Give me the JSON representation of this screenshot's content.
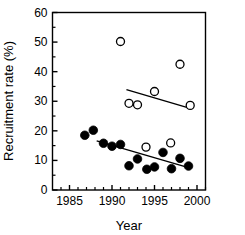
{
  "chart_data": {
    "type": "scatter",
    "title": "",
    "xlabel": "Year",
    "ylabel": "Recruitment rate (%)",
    "xlim": [
      1983,
      2001
    ],
    "ylim": [
      0,
      60
    ],
    "xticks": [
      1985,
      1990,
      1995,
      2000
    ],
    "xtick_labels": [
      "1985",
      "1990",
      "1995",
      "2000"
    ],
    "xminor_ticks": [
      1984,
      1986,
      1987,
      1988,
      1989,
      1991,
      1992,
      1993,
      1994,
      1996,
      1997,
      1998,
      1999,
      2001
    ],
    "yticks": [
      0,
      10,
      20,
      30,
      40,
      50,
      60
    ],
    "ytick_labels": [
      "0",
      "10",
      "20",
      "30",
      "40",
      "50",
      "60"
    ],
    "yminor_ticks": [
      5,
      15,
      25,
      35,
      45,
      55
    ],
    "grid": false,
    "legend": "none",
    "series": [
      {
        "name": "closed-circles",
        "marker": "filled-circle",
        "color": "#000000",
        "points": [
          {
            "x": 1986.8,
            "y": 18.5
          },
          {
            "x": 1987.8,
            "y": 20.2
          },
          {
            "x": 1989.0,
            "y": 15.8
          },
          {
            "x": 1990.0,
            "y": 14.8
          },
          {
            "x": 1991.0,
            "y": 15.4
          },
          {
            "x": 1992.0,
            "y": 8.2
          },
          {
            "x": 1993.0,
            "y": 10.5
          },
          {
            "x": 1994.1,
            "y": 7.0
          },
          {
            "x": 1995.0,
            "y": 7.8
          },
          {
            "x": 1996.0,
            "y": 12.7
          },
          {
            "x": 1997.0,
            "y": 7.2
          },
          {
            "x": 1998.0,
            "y": 10.7
          },
          {
            "x": 1999.0,
            "y": 8.1
          }
        ]
      },
      {
        "name": "open-circles",
        "marker": "open-circle",
        "color": "#000000",
        "points": [
          {
            "x": 1991.0,
            "y": 50.2
          },
          {
            "x": 1992.0,
            "y": 29.3
          },
          {
            "x": 1993.0,
            "y": 28.8
          },
          {
            "x": 1994.0,
            "y": 14.5
          },
          {
            "x": 1995.0,
            "y": 33.3
          },
          {
            "x": 1996.9,
            "y": 15.9
          },
          {
            "x": 1998.0,
            "y": 42.5
          },
          {
            "x": 1999.2,
            "y": 28.6
          }
        ]
      }
    ],
    "trend_lines": [
      {
        "name": "closed-circle-regression",
        "x1": 1988.2,
        "y1": 16.6,
        "x2": 1999.3,
        "y2": 7.3,
        "color": "#000000"
      },
      {
        "name": "open-circle-regression",
        "x1": 1991.7,
        "y1": 33.9,
        "x2": 1999.4,
        "y2": 27.4,
        "color": "#000000"
      }
    ]
  },
  "axes": {
    "frame_color": "#000000",
    "x_axis_title": "Year",
    "y_axis_title": "Recruitment rate (%)"
  }
}
